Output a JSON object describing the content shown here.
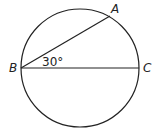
{
  "diagram": {
    "type": "circle-geometry",
    "circle": {
      "cx": 80,
      "cy": 68,
      "r": 59,
      "stroke": "#222222"
    },
    "points": {
      "A": {
        "label": "A",
        "x": 110,
        "y": 16
      },
      "B": {
        "label": "B",
        "x": 21,
        "y": 68
      },
      "C": {
        "label": "C",
        "x": 139,
        "y": 68
      }
    },
    "segments": [
      {
        "name": "chord-BA",
        "from": "B",
        "to": "A"
      },
      {
        "name": "diameter-BC",
        "from": "B",
        "to": "C"
      }
    ],
    "angle_label": "30°"
  }
}
